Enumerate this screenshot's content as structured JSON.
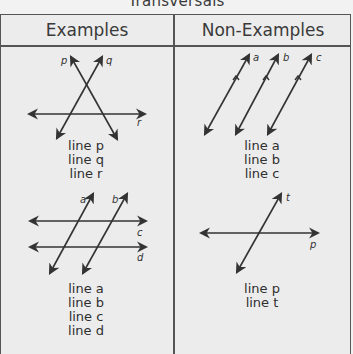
{
  "title": "Transversals",
  "header": {
    "left": "Examples",
    "right": "Non-Examples"
  },
  "examples": [
    {
      "labels": [
        "line p",
        "line q",
        "line r"
      ],
      "line_names": {
        "p": "p",
        "q": "q",
        "r": "r"
      }
    },
    {
      "labels": [
        "line a",
        "line b",
        "line c",
        "line d"
      ],
      "line_names": {
        "a": "a",
        "b": "b",
        "c": "c",
        "d": "d"
      }
    }
  ],
  "non_examples": [
    {
      "labels": [
        "line a",
        "line b",
        "line c"
      ],
      "line_names": {
        "a": "a",
        "b": "b",
        "c": "c"
      }
    },
    {
      "labels": [
        "line p",
        "line t"
      ],
      "line_names": {
        "p": "p",
        "t": "t"
      }
    }
  ],
  "colors": {
    "background": "#ececec",
    "border": "#555555",
    "ink": "#2f2f2f"
  }
}
